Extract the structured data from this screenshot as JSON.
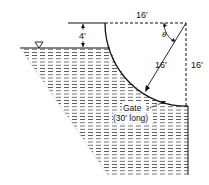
{
  "diagram": {
    "type": "fluid-mechanics-curved-gate",
    "labels": {
      "depth_above_surface": "4'",
      "top_width": "16'",
      "right_height": "16'",
      "radius": "16'",
      "angle": "θ",
      "gate_name": "Gate",
      "gate_length": "(30' long)"
    },
    "symbols": {
      "water_surface_marker": "inverted-triangle"
    },
    "colors": {
      "line": "#111111",
      "water_hatch": "#333333",
      "background": "#ffffff"
    }
  }
}
